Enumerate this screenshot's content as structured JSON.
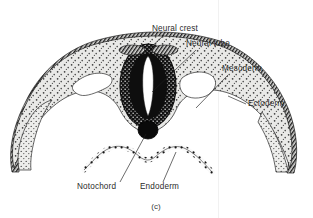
{
  "figure": {
    "caption": "(c)",
    "background_color": "#ffffff",
    "ink_color": "#1e1e1e",
    "tissue_fill": "#e8e8e6",
    "label_color": "#2b2b2b"
  },
  "labels": [
    {
      "id": "neural-crest",
      "text": "Neural crest",
      "x": 152,
      "y": 31,
      "anchor": "start"
    },
    {
      "id": "neural-tube",
      "text": "Neural tube",
      "x": 186,
      "y": 46,
      "anchor": "start"
    },
    {
      "id": "mesoderm",
      "text": "Mesoderm",
      "x": 222,
      "y": 71,
      "anchor": "start"
    },
    {
      "id": "ectoderm",
      "text": "Ectoderm",
      "x": 248,
      "y": 106,
      "anchor": "start"
    },
    {
      "id": "notochord",
      "text": "Notochord",
      "x": 77,
      "y": 189,
      "anchor": "start"
    },
    {
      "id": "endoderm",
      "text": "Endoderm",
      "x": 140,
      "y": 189,
      "anchor": "start"
    }
  ],
  "structures": [
    {
      "id": "ectoderm-layer",
      "name": "Ectoderm"
    },
    {
      "id": "mesoderm-layer",
      "name": "Mesoderm"
    },
    {
      "id": "endoderm-layer",
      "name": "Endoderm"
    },
    {
      "id": "neural-tube-body",
      "name": "Neural tube"
    },
    {
      "id": "neural-crest-cells",
      "name": "Neural crest"
    },
    {
      "id": "notochord-body",
      "name": "Notochord"
    },
    {
      "id": "coelom-left",
      "name": "Coelom (left)"
    },
    {
      "id": "coelom-right",
      "name": "Coelom (right)"
    }
  ]
}
